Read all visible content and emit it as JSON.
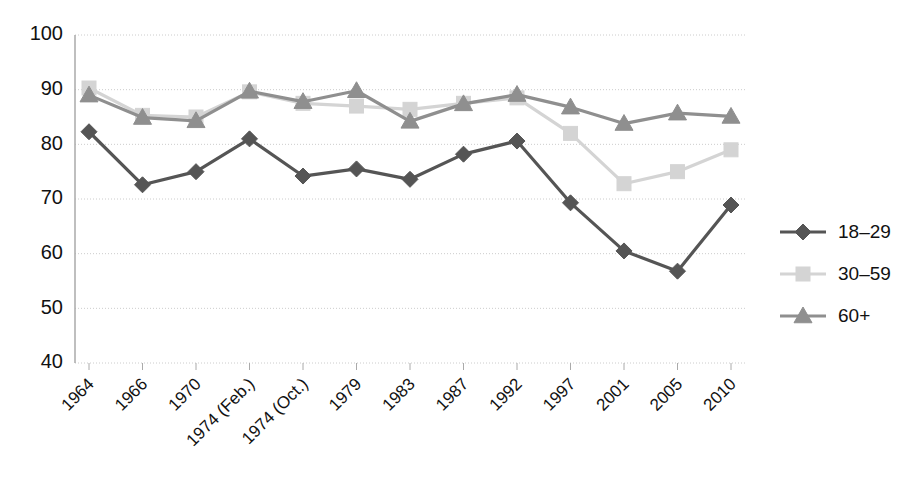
{
  "chart_data": {
    "type": "line",
    "title": "",
    "subtitle": "",
    "xlabel": "",
    "ylabel": "",
    "ylim": [
      40,
      100
    ],
    "ytick_step": 10,
    "yticks": [
      "40",
      "50",
      "60",
      "70",
      "80",
      "90",
      "100"
    ],
    "grid": true,
    "grid_axis": "y",
    "legend_position": "right",
    "categories": [
      "1964",
      "1966",
      "1970",
      "1974 (Feb.)",
      "1974 (Oct.)",
      "1979",
      "1983",
      "1987",
      "1992",
      "1997",
      "2001",
      "2005",
      "2010"
    ],
    "series": [
      {
        "name": "18–29",
        "marker": "diamond",
        "color": "#555555",
        "values": [
          82.3,
          72.6,
          75.0,
          81.0,
          74.2,
          75.5,
          73.6,
          78.2,
          80.6,
          69.3,
          60.5,
          56.8,
          68.9
        ]
      },
      {
        "name": "30–59",
        "marker": "square",
        "color": "#d4d4d4",
        "values": [
          90.3,
          85.3,
          85.0,
          89.6,
          87.5,
          87.0,
          86.4,
          87.5,
          88.5,
          82.0,
          72.8,
          75.0,
          79.0
        ]
      },
      {
        "name": "60+",
        "marker": "triangle",
        "color": "#8f8f8f",
        "values": [
          89.0,
          84.9,
          84.3,
          89.7,
          87.8,
          89.8,
          84.2,
          87.4,
          89.1,
          86.8,
          83.8,
          85.7,
          85.1
        ]
      }
    ]
  },
  "legend": {
    "entries": [
      {
        "label": "18–29"
      },
      {
        "label": "30–59"
      },
      {
        "label": "60+"
      }
    ]
  },
  "colors": {
    "series_18_29": "#555555",
    "series_30_59": "#d4d4d4",
    "series_60_plus": "#8f8f8f",
    "axis": "#aaaaaa",
    "grid": "#cccccc",
    "text": "#111111",
    "background": "#ffffff"
  }
}
